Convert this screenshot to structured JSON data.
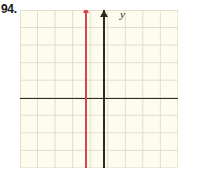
{
  "problem": {
    "number": "94."
  },
  "axes": {
    "x_label": "x",
    "y_label": "y"
  },
  "colors": {
    "grid_line": "#e4ddc8",
    "grid_background": "#fcfcef",
    "axis": "#2b2b22",
    "plot_line": "#d6454a",
    "text": "#1a1a1a"
  },
  "chart_data": {
    "type": "line",
    "title": "",
    "xlabel": "x",
    "ylabel": "y",
    "grid": true,
    "legend": null,
    "xlim": [
      -5,
      4
    ],
    "ylim": [
      -4,
      5
    ],
    "x_tick_step": 1,
    "y_tick_step": 1,
    "tick_labels_shown": false,
    "series": [
      {
        "name": "vertical line",
        "equation": "x = -1",
        "color": "#d6454a",
        "orientation": "vertical",
        "x": -1,
        "y_range": [
          -4,
          5
        ],
        "arrow_ends": [
          "top"
        ],
        "points": [
          {
            "x": -1,
            "y": -4
          },
          {
            "x": -1,
            "y": 5
          }
        ]
      }
    ]
  }
}
